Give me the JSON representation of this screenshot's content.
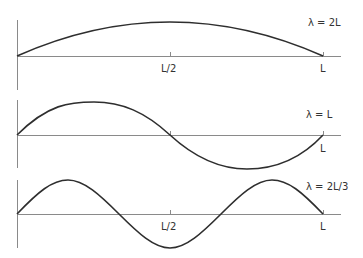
{
  "diagram": {
    "colors": {
      "axis": "#8a8a8a",
      "curve": "#2e2e2e",
      "text": "#333333",
      "background": "#ffffff"
    },
    "x_labels": {
      "half": "L/2",
      "end": "L"
    },
    "panels": [
      {
        "mode": 1,
        "wavelength_label": "λ = 2L",
        "half_wavelengths": 1,
        "show_half_label": true,
        "show_end_label": true
      },
      {
        "mode": 2,
        "wavelength_label": "λ = L",
        "half_wavelengths": 2,
        "show_half_label": false,
        "show_end_label": true
      },
      {
        "mode": 3,
        "wavelength_label": "λ = 2L/3",
        "half_wavelengths": 3,
        "show_half_label": true,
        "show_end_label": true
      }
    ]
  }
}
